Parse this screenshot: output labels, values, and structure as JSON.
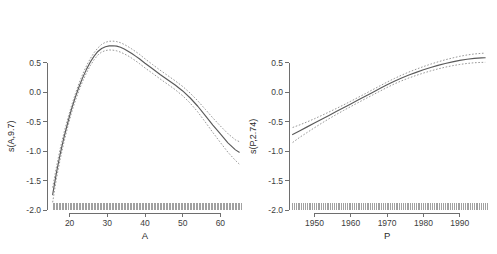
{
  "figure": {
    "background": "#ffffff",
    "line_color": "#5a5a5a",
    "ci_color": "#8c8c8c",
    "axis_color": "#6e6e6e"
  },
  "chart_data": [
    {
      "type": "line",
      "panel": "left",
      "title": "",
      "xlabel": "A",
      "ylabel": "s(A,9.7)",
      "xlim": [
        14.0,
        66.0
      ],
      "ylim": [
        -2.0,
        0.85
      ],
      "xticks": [
        20,
        30,
        40,
        50,
        60
      ],
      "xticklabels": [
        "20",
        "30",
        "40",
        "50",
        "60"
      ],
      "yticks": [
        0.5,
        0.0,
        -0.5,
        -1.0,
        -1.5,
        -2.0
      ],
      "yticklabels": [
        "0.5",
        "0.0",
        "-0.5",
        "-1.0",
        "-1.5",
        "-2.0"
      ],
      "grid": false,
      "legend": "none",
      "series": [
        {
          "name": "fit",
          "style": "solid",
          "x": [
            15.5,
            16.5,
            17.5,
            18.5,
            19.5,
            20.5,
            21.5,
            22.5,
            23.5,
            24.5,
            25.5,
            26.5,
            27.5,
            28.5,
            29.5,
            30.5,
            31.5,
            32.5,
            33.5,
            34.5,
            35.5,
            36.5,
            37.5,
            38.5,
            40.0,
            42.0,
            44.0,
            46.0,
            48.0,
            50.0,
            52.0,
            54.0,
            56.0,
            58.0,
            60.0,
            62.0,
            64.0,
            65.0
          ],
          "y": [
            -1.74,
            -1.37,
            -1.05,
            -0.77,
            -0.52,
            -0.29,
            -0.09,
            0.09,
            0.25,
            0.39,
            0.51,
            0.61,
            0.69,
            0.74,
            0.77,
            0.785,
            0.787,
            0.78,
            0.76,
            0.73,
            0.695,
            0.655,
            0.61,
            0.565,
            0.49,
            0.395,
            0.3,
            0.21,
            0.12,
            0.02,
            -0.1,
            -0.24,
            -0.4,
            -0.56,
            -0.71,
            -0.86,
            -0.98,
            -1.02
          ]
        },
        {
          "name": "upper_ci",
          "style": "dashed",
          "x": [
            15.5,
            16.5,
            17.5,
            18.5,
            19.5,
            20.5,
            21.5,
            22.5,
            23.5,
            24.5,
            25.5,
            26.5,
            27.5,
            28.5,
            29.5,
            30.5,
            31.5,
            32.5,
            33.5,
            34.5,
            35.5,
            36.5,
            37.5,
            38.5,
            40.0,
            42.0,
            44.0,
            46.0,
            48.0,
            50.0,
            52.0,
            54.0,
            56.0,
            58.0,
            60.0,
            62.0,
            64.0,
            65.0
          ],
          "y": [
            -1.62,
            -1.27,
            -0.96,
            -0.69,
            -0.45,
            -0.23,
            -0.03,
            0.15,
            0.31,
            0.45,
            0.57,
            0.67,
            0.75,
            0.81,
            0.845,
            0.862,
            0.865,
            0.857,
            0.838,
            0.808,
            0.772,
            0.732,
            0.688,
            0.643,
            0.565,
            0.468,
            0.372,
            0.282,
            0.192,
            0.096,
            -0.018,
            -0.148,
            -0.292,
            -0.438,
            -0.575,
            -0.705,
            -0.81,
            -0.84
          ]
        },
        {
          "name": "lower_ci",
          "style": "dashed",
          "x": [
            15.5,
            16.5,
            17.5,
            18.5,
            19.5,
            20.5,
            21.5,
            22.5,
            23.5,
            24.5,
            25.5,
            26.5,
            27.5,
            28.5,
            29.5,
            30.5,
            31.5,
            32.5,
            33.5,
            34.5,
            35.5,
            36.5,
            37.5,
            38.5,
            40.0,
            42.0,
            44.0,
            46.0,
            48.0,
            50.0,
            52.0,
            54.0,
            56.0,
            58.0,
            60.0,
            62.0,
            64.0,
            65.0
          ],
          "y": [
            -1.87,
            -1.47,
            -1.14,
            -0.85,
            -0.59,
            -0.35,
            -0.15,
            0.03,
            0.19,
            0.33,
            0.45,
            0.55,
            0.63,
            0.68,
            0.705,
            0.715,
            0.712,
            0.7,
            0.678,
            0.648,
            0.615,
            0.575,
            0.53,
            0.485,
            0.41,
            0.318,
            0.224,
            0.134,
            0.042,
            -0.062,
            -0.188,
            -0.336,
            -0.508,
            -0.685,
            -0.855,
            -1.02,
            -1.16,
            -1.22
          ]
        }
      ],
      "rug": {
        "n": 52,
        "values": [
          15.6,
          16.4,
          17.2,
          18.0,
          18.8,
          19.6,
          20.4,
          21.2,
          22.0,
          22.8,
          23.6,
          24.4,
          25.2,
          26.0,
          26.8,
          27.6,
          28.4,
          29.2,
          30.0,
          30.8,
          31.6,
          32.4,
          33.2,
          34.0,
          34.8,
          35.6,
          36.4,
          37.2,
          38.0,
          38.8,
          39.6,
          40.4,
          41.2,
          42.0,
          42.8,
          43.6,
          44.4,
          45.2,
          46.0,
          46.8,
          47.6,
          48.4,
          49.2,
          50.0,
          50.8,
          51.6,
          52.4,
          53.2,
          54.0,
          54.8,
          55.6,
          56.4,
          57.2,
          58.0,
          58.8,
          59.6,
          60.4,
          61.2,
          62.0,
          62.8,
          63.6,
          64.4,
          65.2
        ]
      }
    },
    {
      "type": "line",
      "panel": "right",
      "title": "",
      "xlabel": "P",
      "ylabel": "s(P,2.74)",
      "xlim": [
        1943.0,
        1997.5
      ],
      "ylim": [
        -2.0,
        0.85
      ],
      "xticks": [
        1950,
        1960,
        1970,
        1980,
        1990
      ],
      "xticklabels": [
        "1950",
        "1960",
        "1970",
        "1980",
        "1990"
      ],
      "yticks": [
        0.5,
        0.0,
        -0.5,
        -1.0,
        -1.5,
        -2.0
      ],
      "yticklabels": [
        "0.5",
        "0.0",
        "-0.5",
        "-1.0",
        "-1.5",
        "-2.0"
      ],
      "grid": false,
      "legend": "none",
      "series": [
        {
          "name": "fit",
          "style": "solid",
          "x": [
            1944,
            1946,
            1948,
            1950,
            1952,
            1954,
            1956,
            1958,
            1960,
            1962,
            1964,
            1966,
            1968,
            1970,
            1972,
            1974,
            1976,
            1978,
            1980,
            1982,
            1984,
            1986,
            1988,
            1990,
            1992,
            1994,
            1996,
            1997
          ],
          "y": [
            -0.72,
            -0.655,
            -0.59,
            -0.525,
            -0.46,
            -0.395,
            -0.33,
            -0.265,
            -0.2,
            -0.135,
            -0.07,
            -0.005,
            0.06,
            0.125,
            0.185,
            0.24,
            0.29,
            0.335,
            0.378,
            0.418,
            0.453,
            0.485,
            0.513,
            0.538,
            0.558,
            0.572,
            0.58,
            0.582
          ]
        },
        {
          "name": "upper_ci",
          "style": "dashed",
          "x": [
            1944,
            1946,
            1948,
            1950,
            1952,
            1954,
            1956,
            1958,
            1960,
            1962,
            1964,
            1966,
            1968,
            1970,
            1972,
            1974,
            1976,
            1978,
            1980,
            1982,
            1984,
            1986,
            1988,
            1990,
            1992,
            1994,
            1996,
            1997
          ],
          "y": [
            -0.6,
            -0.555,
            -0.505,
            -0.452,
            -0.396,
            -0.338,
            -0.279,
            -0.218,
            -0.155,
            -0.091,
            -0.026,
            0.04,
            0.105,
            0.17,
            0.231,
            0.288,
            0.34,
            0.388,
            0.433,
            0.475,
            0.513,
            0.548,
            0.579,
            0.607,
            0.63,
            0.647,
            0.658,
            0.661
          ]
        },
        {
          "name": "lower_ci",
          "style": "dashed",
          "x": [
            1944,
            1946,
            1948,
            1950,
            1952,
            1954,
            1956,
            1958,
            1960,
            1962,
            1964,
            1966,
            1968,
            1970,
            1972,
            1974,
            1976,
            1978,
            1980,
            1982,
            1984,
            1986,
            1988,
            1990,
            1992,
            1994,
            1996,
            1997
          ],
          "y": [
            -0.855,
            -0.765,
            -0.685,
            -0.605,
            -0.527,
            -0.452,
            -0.381,
            -0.312,
            -0.245,
            -0.179,
            -0.114,
            -0.05,
            0.015,
            0.079,
            0.139,
            0.192,
            0.24,
            0.283,
            0.323,
            0.36,
            0.393,
            0.423,
            0.448,
            0.469,
            0.486,
            0.498,
            0.504,
            0.505
          ]
        }
      ],
      "rug": {
        "n": 54,
        "values": [
          1944,
          1945,
          1946,
          1947,
          1948,
          1949,
          1950,
          1951,
          1952,
          1953,
          1954,
          1955,
          1956,
          1957,
          1958,
          1959,
          1960,
          1961,
          1962,
          1963,
          1964,
          1965,
          1966,
          1967,
          1968,
          1969,
          1970,
          1971,
          1972,
          1973,
          1974,
          1975,
          1976,
          1977,
          1978,
          1979,
          1980,
          1981,
          1982,
          1983,
          1984,
          1985,
          1986,
          1987,
          1988,
          1989,
          1990,
          1991,
          1992,
          1993,
          1994,
          1995,
          1996,
          1997
        ]
      }
    }
  ]
}
